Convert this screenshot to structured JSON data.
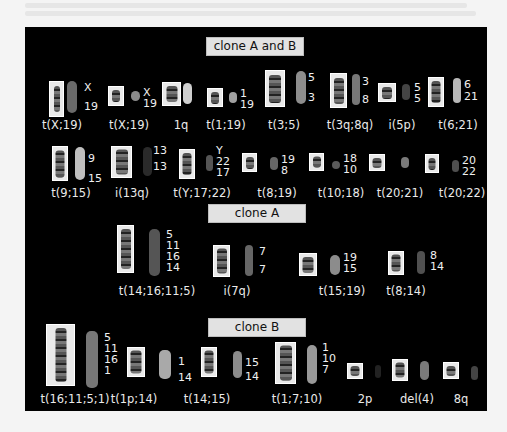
{
  "sections": [
    {
      "title": "clone A and B",
      "header": {
        "left": 206,
        "top": 37,
        "width": 96
      },
      "items": [
        {
          "caption": "t(X;19)",
          "labels": [
            "X",
            "19"
          ],
          "box": [
            49,
            81,
            13,
            34
          ],
          "chr": [
            6,
            26
          ],
          "paint": [
            67,
            81,
            10,
            32,
            "#6a6a6a"
          ],
          "lab": [
            84,
            82
          ],
          "cap": [
            62,
            126
          ]
        },
        {
          "caption": "t(X;19)",
          "labels": [
            "X",
            "19"
          ],
          "box": [
            108,
            86,
            14,
            18
          ],
          "chr": [
            8,
            12
          ],
          "paint": [
            131,
            91,
            9,
            10,
            "#8a8a8a"
          ],
          "lab": [
            143,
            87
          ],
          "cap": [
            129,
            126
          ]
        },
        {
          "caption": "1q",
          "labels": [],
          "box": [
            162,
            82,
            17,
            22
          ],
          "chr": [
            11,
            16
          ],
          "paint": [
            183,
            83,
            9,
            21,
            "#cfcfcf"
          ],
          "lab": null,
          "cap": [
            181,
            126
          ]
        },
        {
          "caption": "t(1;19)",
          "labels": [
            "1",
            "19"
          ],
          "box": [
            207,
            88,
            14,
            17
          ],
          "chr": [
            8,
            12
          ],
          "paint": [
            229,
            92,
            8,
            11,
            "#a0a0a0"
          ],
          "lab": [
            240,
            88
          ],
          "cap": [
            226,
            126
          ]
        },
        {
          "caption": "t(3;5)",
          "labels": [
            "5",
            "3"
          ],
          "box": [
            265,
            70,
            18,
            35
          ],
          "chr": [
            12,
            28
          ],
          "paint": [
            296,
            71,
            10,
            33,
            "#8d8d8d"
          ],
          "lab": [
            308,
            72
          ],
          "cap": [
            284,
            126
          ]
        },
        {
          "caption": "t(3q;8q)",
          "labels": [
            "3",
            "8"
          ],
          "box": [
            330,
            73,
            15,
            33
          ],
          "chr": [
            10,
            26
          ],
          "paint": [
            352,
            74,
            8,
            31,
            "#777"
          ],
          "lab": [
            362,
            76
          ],
          "cap": [
            350,
            126
          ]
        },
        {
          "caption": "i(5p)",
          "labels": [
            "5",
            "5"
          ],
          "box": [
            378,
            83,
            16,
            17
          ],
          "chr": [
            10,
            12
          ],
          "paint": [
            402,
            84,
            8,
            16,
            "#444"
          ],
          "lab": [
            414,
            82
          ],
          "cap": [
            402,
            126
          ]
        },
        {
          "caption": "t(6;21)",
          "labels": [
            "6",
            "21"
          ],
          "box": [
            428,
            77,
            14,
            28
          ],
          "chr": [
            9,
            22
          ],
          "paint": [
            453,
            78,
            8,
            25,
            "#b8b8b8"
          ],
          "lab": [
            464,
            79
          ],
          "cap": [
            458,
            126
          ]
        },
        {
          "caption": "t(9;15)",
          "labels": [
            "9",
            "15"
          ],
          "box": [
            52,
            146,
            14,
            33
          ],
          "chr": [
            9,
            27
          ],
          "paint": [
            75,
            147,
            10,
            33,
            "#bfbfbf"
          ],
          "lab": [
            88,
            153
          ],
          "cap": [
            71,
            194
          ]
        },
        {
          "caption": "i(13q)",
          "labels": [
            "13",
            "13"
          ],
          "box": [
            111,
            146,
            19,
            30
          ],
          "chr": [
            12,
            25
          ],
          "paint": [
            143,
            147,
            9,
            29,
            "#2a2a2a"
          ],
          "lab": [
            153,
            145
          ],
          "cap": [
            132,
            194
          ]
        },
        {
          "caption": "t(Y;17;22)",
          "labels": [
            "Y",
            "22",
            "17"
          ],
          "box": [
            179,
            149,
            14,
            28
          ],
          "chr": [
            9,
            22
          ],
          "paint": [
            206,
            155,
            7,
            16,
            "#555"
          ],
          "lab": [
            216,
            145
          ],
          "cap": [
            202,
            194
          ]
        },
        {
          "caption": "t(8;19)",
          "labels": [
            "19",
            "8"
          ],
          "box": [
            242,
            153,
            13,
            17
          ],
          "chr": [
            8,
            12
          ],
          "paint": [
            270,
            157,
            8,
            13,
            "#666"
          ],
          "lab": [
            281,
            154
          ],
          "cap": [
            277,
            194
          ]
        },
        {
          "caption": "t(10;18)",
          "labels": [
            "18",
            "10"
          ],
          "box": [
            309,
            153,
            13,
            16
          ],
          "chr": [
            8,
            11
          ],
          "paint": [
            332,
            161,
            8,
            8,
            "#5a5a5a"
          ],
          "lab": [
            343,
            153
          ],
          "cap": [
            341,
            194
          ]
        },
        {
          "caption": "t(20;21)",
          "labels": [],
          "box": [
            369,
            154,
            14,
            15
          ],
          "chr": [
            9,
            10
          ],
          "paint": [
            401,
            157,
            8,
            11,
            "#7a7a7a"
          ],
          "lab": null,
          "cap": [
            400,
            194
          ]
        },
        {
          "caption": "t(20;22)",
          "labels": [
            "20",
            "22"
          ],
          "box": [
            425,
            154,
            12,
            17
          ],
          "chr": [
            7,
            12
          ],
          "paint": [
            452,
            160,
            7,
            12,
            "#4f4f4f"
          ],
          "lab": [
            462,
            155
          ],
          "cap": [
            462,
            194
          ]
        }
      ]
    },
    {
      "title": "clone A",
      "header": {
        "left": 208,
        "top": 204,
        "width": 96
      },
      "items": [
        {
          "caption": "t(14;16;11;5)",
          "labels": [
            "5",
            "11",
            "16",
            "14"
          ],
          "box": [
            117,
            225,
            15,
            46
          ],
          "chr": [
            10,
            40
          ],
          "paint": [
            149,
            229,
            11,
            47,
            "#555"
          ],
          "lab": [
            166,
            229
          ],
          "cap": [
            157,
            292
          ]
        },
        {
          "caption": "i(7q)",
          "labels": [
            "7",
            "7"
          ],
          "box": [
            213,
            245,
            15,
            30
          ],
          "chr": [
            10,
            25
          ],
          "paint": [
            245,
            245,
            8,
            31,
            "#666"
          ],
          "lab": [
            259,
            246
          ],
          "cap": [
            237,
            292
          ]
        },
        {
          "caption": "t(15;19)",
          "labels": [
            "19",
            "15"
          ],
          "box": [
            299,
            253,
            16,
            21
          ],
          "chr": [
            11,
            16
          ],
          "paint": [
            330,
            255,
            10,
            20,
            "#8c8c8c"
          ],
          "lab": [
            343,
            252
          ],
          "cap": [
            342,
            292
          ]
        },
        {
          "caption": "t(8;14)",
          "labels": [
            "8",
            "14"
          ],
          "box": [
            388,
            251,
            14,
            22
          ],
          "chr": [
            9,
            17
          ],
          "paint": [
            417,
            251,
            8,
            23,
            "#505050"
          ],
          "lab": [
            430,
            250
          ],
          "cap": [
            406,
            292
          ]
        }
      ]
    },
    {
      "title": "clone B",
      "header": {
        "left": 208,
        "top": 318,
        "width": 96
      },
      "items": [
        {
          "caption": "t(16;11;5;1)",
          "labels": [
            "5",
            "11",
            "16",
            "1"
          ],
          "box": [
            46,
            324,
            27,
            60
          ],
          "chr": [
            11,
            54
          ],
          "paint": [
            86,
            331,
            12,
            57,
            "#777"
          ],
          "lab": [
            104,
            332
          ],
          "cap": [
            75,
            400
          ]
        },
        {
          "caption": "t(1p;14)",
          "labels": [
            "1",
            "14"
          ],
          "box": [
            127,
            347,
            16,
            28
          ],
          "chr": [
            11,
            23
          ],
          "paint": [
            159,
            350,
            12,
            29,
            "#a9a9a9"
          ],
          "lab": [
            178,
            356
          ],
          "cap": [
            134,
            400
          ]
        },
        {
          "caption": "t(14;15)",
          "labels": [
            "15",
            "14"
          ],
          "box": [
            201,
            347,
            14,
            28
          ],
          "chr": [
            9,
            23
          ],
          "paint": [
            233,
            351,
            9,
            27,
            "#8b8b8b"
          ],
          "lab": [
            245,
            357
          ],
          "cap": [
            207,
            400
          ]
        },
        {
          "caption": "t(1;7;10)",
          "labels": [
            "1",
            "10",
            "7"
          ],
          "box": [
            275,
            342,
            19,
            40
          ],
          "chr": [
            12,
            35
          ],
          "paint": [
            307,
            345,
            10,
            39,
            "#999"
          ],
          "lab": [
            322,
            342
          ],
          "cap": [
            297,
            400
          ]
        },
        {
          "caption": "2p",
          "labels": [],
          "box": [
            347,
            363,
            14,
            14
          ],
          "chr": [
            9,
            10
          ],
          "paint": [
            375,
            365,
            6,
            13,
            "#222"
          ],
          "lab": null,
          "cap": [
            365,
            400
          ]
        },
        {
          "caption": "del(4)",
          "labels": [],
          "box": [
            392,
            359,
            14,
            20
          ],
          "chr": [
            9,
            15
          ],
          "paint": [
            420,
            361,
            9,
            19,
            "#7a7a7a"
          ],
          "lab": null,
          "cap": [
            417,
            400
          ]
        },
        {
          "caption": "8q",
          "labels": [],
          "box": [
            443,
            362,
            14,
            15
          ],
          "chr": [
            9,
            10
          ],
          "paint": [
            471,
            366,
            7,
            14,
            "#444"
          ],
          "lab": null,
          "cap": [
            461,
            400
          ]
        }
      ]
    }
  ]
}
